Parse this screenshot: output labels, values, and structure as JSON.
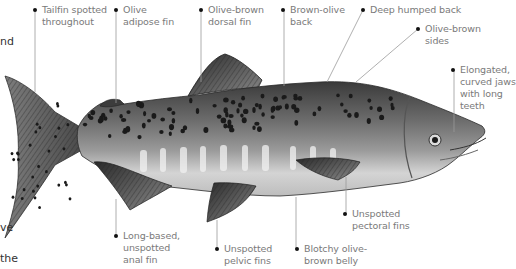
{
  "figure": {
    "style": "grayscale",
    "left_margin_fragments": [
      "nd",
      "ve",
      "the"
    ],
    "callouts": [
      {
        "id": "tailfin",
        "lines": [
          "Tailfin spotted",
          "throughout"
        ]
      },
      {
        "id": "adipose",
        "lines": [
          "Olive",
          "adipose fin"
        ]
      },
      {
        "id": "dorsal",
        "lines": [
          "Olive-brown",
          "dorsal fin"
        ]
      },
      {
        "id": "back",
        "lines": [
          "Brown-olive",
          "back"
        ]
      },
      {
        "id": "hump",
        "lines": [
          "Deep humped back"
        ]
      },
      {
        "id": "sides",
        "lines": [
          "Olive-brown",
          "sides"
        ]
      },
      {
        "id": "jaws",
        "lines": [
          "Elongated,",
          "curved jaws",
          "with long",
          "teeth"
        ]
      },
      {
        "id": "pectoral",
        "lines": [
          "Unspotted",
          "pectoral fins"
        ]
      },
      {
        "id": "belly",
        "lines": [
          "Blotchy olive-",
          "brown belly"
        ]
      },
      {
        "id": "pelvic",
        "lines": [
          "Unspotted",
          "pelvic fins"
        ]
      },
      {
        "id": "anal",
        "lines": [
          "Long-based,",
          "unspotted",
          "anal fin"
        ]
      }
    ]
  }
}
